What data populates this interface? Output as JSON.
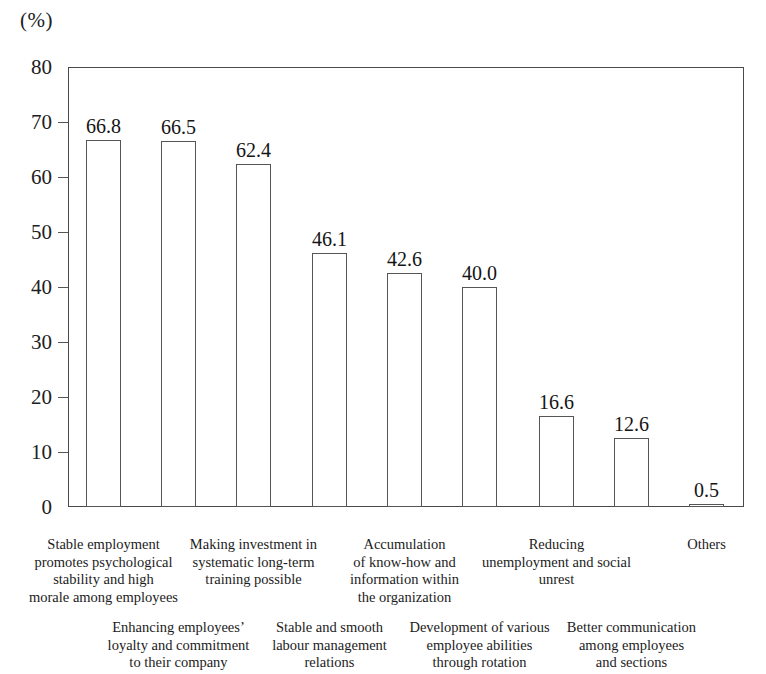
{
  "chart_data": {
    "type": "bar",
    "title": "",
    "subtitle": "",
    "xlabel": "",
    "ylabel": "(%)",
    "unit_label": "(%)",
    "ylim": [
      0,
      80
    ],
    "ytick_step": 10,
    "yticks": [
      "80",
      "70",
      "60",
      "50",
      "40",
      "30",
      "20",
      "10",
      "0"
    ],
    "ytick_values": [
      80,
      70,
      60,
      50,
      40,
      30,
      20,
      10,
      0
    ],
    "grid": false,
    "legend": false,
    "legend_position": "none",
    "categories": [
      "Stable employment promotes psychological stability and high morale among employees",
      "Enhancing employees’ loyalty and commitment to their company",
      "Making investment in systematic long-term training possible",
      "Stable and smooth labour management relations",
      "Accumulation of know-how and information within the organization",
      "Development of various employee abilities through rotation",
      "Reducing unemployment and social unrest",
      "Better communication among employees and sections",
      "Others"
    ],
    "values": [
      66.8,
      66.5,
      62.4,
      46.1,
      42.6,
      40.0,
      16.6,
      12.6,
      0.5
    ],
    "value_labels": [
      "66.8",
      "66.5",
      "62.4",
      "46.1",
      "42.6",
      "40.0",
      "16.6",
      "12.6",
      "0.5"
    ],
    "bars": [
      {
        "value": 66.8,
        "value_label": "66.8",
        "label_lines": [
          "Stable employment",
          "promotes psychological",
          "stability and high",
          "morale among employees"
        ],
        "label_row": 1,
        "x": 86,
        "width": 35
      },
      {
        "value": 66.5,
        "value_label": "66.5",
        "label_lines": [
          "Enhancing employees’",
          "loyalty and commitment",
          "to their company"
        ],
        "label_row": 2,
        "x": 161,
        "width": 35
      },
      {
        "value": 62.4,
        "value_label": "62.4",
        "label_lines": [
          "Making investment in",
          "systematic long-term",
          "training possible"
        ],
        "label_row": 1,
        "x": 236,
        "width": 35
      },
      {
        "value": 46.1,
        "value_label": "46.1",
        "label_lines": [
          "Stable and smooth",
          "labour management",
          "relations"
        ],
        "label_row": 2,
        "x": 312,
        "width": 35
      },
      {
        "value": 42.6,
        "value_label": "42.6",
        "label_lines": [
          "Accumulation",
          "of know-how and",
          "information within",
          "the organization"
        ],
        "label_row": 1,
        "x": 387,
        "width": 35
      },
      {
        "value": 40.0,
        "value_label": "40.0",
        "label_lines": [
          "Development of various",
          "employee abilities",
          "through rotation"
        ],
        "label_row": 2,
        "x": 462,
        "width": 35
      },
      {
        "value": 16.6,
        "value_label": "16.6",
        "label_lines": [
          "Reducing",
          "unemployment and social",
          "unrest"
        ],
        "label_row": 1,
        "x": 539,
        "width": 35
      },
      {
        "value": 12.6,
        "value_label": "12.6",
        "label_lines": [
          "Better communication",
          "among employees",
          "and sections"
        ],
        "label_row": 2,
        "x": 614,
        "width": 35
      },
      {
        "value": 0.5,
        "value_label": "0.5",
        "label_lines": [
          "Others"
        ],
        "label_row": 1,
        "x": 689,
        "width": 35
      }
    ],
    "axis_color": "#555555",
    "bar_fill_color": "#ffffff",
    "bar_border_color": "#555555",
    "text_color": "#1a1a1a",
    "background_color": "#ffffff"
  },
  "layout": {
    "plot_left": 68,
    "plot_top": 67,
    "plot_width": 676,
    "plot_height": 440,
    "label_row1_top": 536,
    "label_row2_top": 619,
    "label_col_width": 178
  }
}
